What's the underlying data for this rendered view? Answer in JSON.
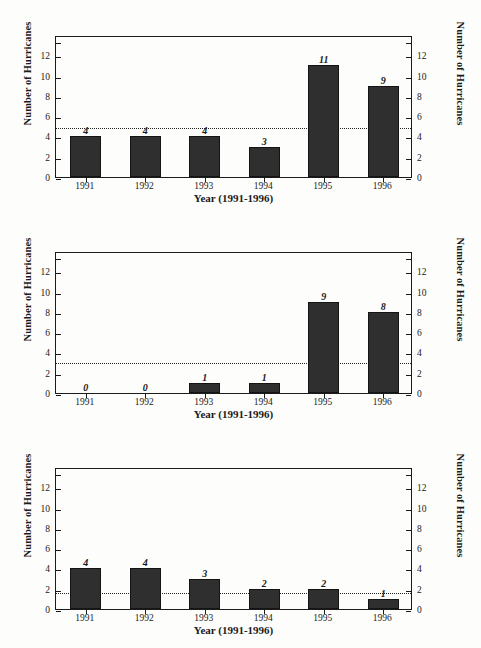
{
  "figure": {
    "axis": {
      "ylabel": "Number  of  Hurricanes",
      "xlabel": "Year (1991-1996)",
      "yticks": [
        "0",
        "2",
        "4",
        "6",
        "8",
        "10",
        "12"
      ],
      "ylim": [
        0,
        14
      ],
      "xticks": [
        "1991",
        "1992",
        "1993",
        "1994",
        "1995",
        "1996"
      ]
    },
    "stats_caption_line1": "Number of Hurricanes"
  },
  "chart_data": [
    {
      "type": "bar",
      "title": "All Hurricanes",
      "categories": [
        "1991",
        "1992",
        "1993",
        "1994",
        "1995",
        "1996"
      ],
      "values": [
        4,
        4,
        4,
        3,
        11,
        9
      ],
      "value_labels": [
        "4",
        "4",
        "4",
        "3",
        "11",
        "9"
      ],
      "mean": 5.8,
      "sd": 3.0,
      "stats_label": "(x, s.d.) = (5.8, 3.0)",
      "stats_prefix": "(",
      "stats_xbar": "x",
      "stats_suffix": ", s.d.) = (5.8, 3.0)",
      "xlabel": "Year (1991-1996)",
      "ylabel": "Number  of  Hurricanes",
      "ylim": [
        0,
        14
      ],
      "grid": false,
      "meanline": 5.0
    },
    {
      "type": "bar",
      "title": "TO Hurricanes",
      "categories": [
        "1991",
        "1992",
        "1993",
        "1994",
        "1995",
        "1996"
      ],
      "values": [
        0,
        0,
        1,
        1,
        9,
        8
      ],
      "value_labels": [
        "0",
        "0",
        "1",
        "1",
        "9",
        "8"
      ],
      "mean": 3.2,
      "sd": 3.8,
      "stats_label": "(x, s.d.) = (3.2, 3.8)",
      "stats_prefix": "(",
      "stats_xbar": "x",
      "stats_suffix": ", s.d.) = (3.2, 3.8)",
      "xlabel": "Year (1991-1996)",
      "ylabel": "Number  of  Hurricanes",
      "ylim": [
        0,
        14
      ],
      "grid": false,
      "meanline": 3.2
    },
    {
      "type": "bar",
      "title": "BE Hurricanes",
      "categories": [
        "1991",
        "1992",
        "1993",
        "1994",
        "1995",
        "1996"
      ],
      "values": [
        4,
        4,
        3,
        2,
        2,
        1
      ],
      "value_labels": [
        "4",
        "4",
        "3",
        "2",
        "2",
        "1"
      ],
      "mean": 2.7,
      "sd": 1.1,
      "stats_label": "(x, s.d.) = (2.7, 1.1)",
      "stats_prefix": "(",
      "stats_xbar": "x",
      "stats_suffix": ", s.d.) = (2.7, 1.1)",
      "xlabel": "Year (1991-1996)",
      "ylabel": "Number  of  Hurricanes",
      "ylim": [
        0,
        14
      ],
      "grid": false,
      "meanline": 1.75
    }
  ],
  "colors": {
    "bar": "#2f2f2f",
    "axis": "#1b1b1b",
    "background": "#fdfdfb"
  }
}
